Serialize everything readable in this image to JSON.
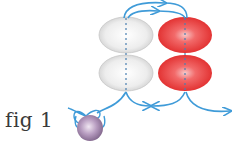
{
  "figure": {
    "label": "fig 1"
  },
  "beads": [
    {
      "name": "white-bead-top",
      "color": "#e8e8e8",
      "row": 1,
      "col": 1
    },
    {
      "name": "red-bead-top",
      "color": "#ea3f3f",
      "row": 1,
      "col": 2
    },
    {
      "name": "white-bead-bottom",
      "color": "#e8e8e8",
      "row": 2,
      "col": 1
    },
    {
      "name": "red-bead-bottom",
      "color": "#ea3f3f",
      "row": 2,
      "col": 2
    },
    {
      "name": "stop-bead",
      "color": "#9a7fa6"
    }
  ],
  "colors": {
    "thread": "#3f9bd8",
    "white_bead": "#e8e8e8",
    "red_bead": "#ea3f3f",
    "stop_bead": "#9a7fa6"
  }
}
